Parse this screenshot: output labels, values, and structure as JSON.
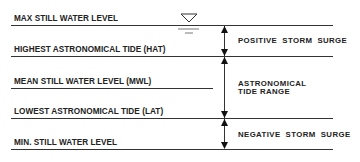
{
  "diagram": {
    "levels": [
      {
        "id": "max",
        "label": "MAX STILL WATER LEVEL"
      },
      {
        "id": "hat",
        "label": "HIGHEST ASTRONOMICAL TIDE (HAT)"
      },
      {
        "id": "mwl",
        "label": "MEAN STILL WATER LEVEL (MWL)"
      },
      {
        "id": "lat",
        "label": "LOWEST ASTRONOMICAL TIDE (LAT)"
      },
      {
        "id": "min",
        "label": "MIN. STILL WATER LEVEL"
      }
    ],
    "ranges": [
      {
        "id": "positive",
        "label": "POSITIVE  STORM  SURGE",
        "from": "max",
        "to": "hat"
      },
      {
        "id": "astro",
        "label_line1": "ASTRONOMICAL",
        "label_line2": "TIDE RANGE",
        "from": "hat",
        "to": "lat"
      },
      {
        "id": "negative",
        "label": "NEGATIVE  STORM  SURGE",
        "from": "lat",
        "to": "min"
      }
    ],
    "symbol": "water-level-triangle-icon"
  }
}
